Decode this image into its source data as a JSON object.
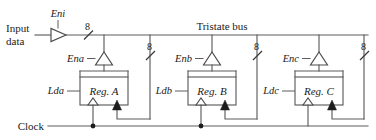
{
  "diagram": {
    "bus_label": "Tristate bus",
    "input_label_line1": "Input",
    "input_label_line2": "data",
    "clock_label": "Clock",
    "input_buffer_enable": "Eni",
    "bus_width": "8",
    "widths": {
      "input": "8",
      "reg_a_out": "8",
      "reg_b_out": "8",
      "reg_c_out": "8"
    },
    "stages": [
      {
        "id": "a",
        "register_label": "Reg. A",
        "load_label": "Lda",
        "enable_label": "Ena",
        "width_label": "8"
      },
      {
        "id": "b",
        "register_label": "Reg. B",
        "load_label": "Ldb",
        "enable_label": "Enb",
        "width_label": "8"
      },
      {
        "id": "c",
        "register_label": "Reg. C",
        "load_label": "Ldc",
        "enable_label": "Enc",
        "width_label": "8"
      }
    ],
    "colors": {
      "wire": "#5d5d5d",
      "text": "#1a1a1a",
      "fill": "#ffffff",
      "node": "#1c1c1c"
    }
  }
}
